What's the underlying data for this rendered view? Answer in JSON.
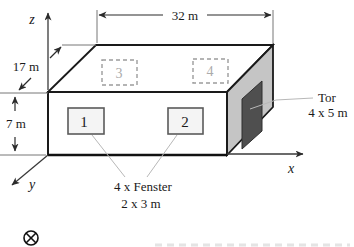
{
  "figure": {
    "axis_labels": {
      "z": "z",
      "y": "y",
      "x": "x"
    },
    "dim_width": "32 m",
    "dim_depth": "17 m",
    "dim_height": "7 m",
    "front_windows": [
      {
        "label": "1"
      },
      {
        "label": "2"
      }
    ],
    "top_windows": [
      {
        "label": "3"
      },
      {
        "label": "4"
      }
    ],
    "door_note": {
      "line1": "Tor",
      "line2": "4 x 5 m"
    },
    "window_note": {
      "line1": "4 x Fenster",
      "line2": "2 x 3 m"
    },
    "colors": {
      "edge": "#1a1a1a",
      "side_face": "#c5c5c5",
      "door": "#4f4f4f",
      "hidden_line": "#b0b0b0",
      "leader_line": "#b8b8b8",
      "dim_line": "#3a3a3a"
    }
  }
}
